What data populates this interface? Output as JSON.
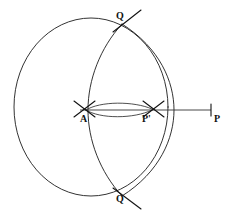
{
  "figure": {
    "background_color": "#ffffff",
    "stroke_color": "#1c1c1c",
    "width": 235,
    "height": 217
  },
  "labels": {
    "q_top": "Q",
    "q_bottom": "Q",
    "a": "A",
    "p_prime": "P'",
    "p": "P"
  },
  "geometry": {
    "main_circle": {
      "name": "main-circle",
      "cx": 91,
      "cy": 107,
      "rx": 77,
      "ry": 89
    },
    "qq_arc": {
      "name": "arc-through-q-top-and-q-bottom",
      "cx": 63,
      "cy": 107,
      "r": 107
    },
    "vertical_arc": {
      "name": "vertical-arc-through-a",
      "cx": 42,
      "cy": 107,
      "r": 98
    },
    "lens_upper": {
      "name": "lens-upper-arc",
      "from_x": 86,
      "from_y": 110,
      "to_x": 150,
      "to_y": 110
    },
    "lens_lower": {
      "name": "lens-lower-arc",
      "from_x": 86,
      "from_y": 110,
      "to_x": 150,
      "to_y": 110
    },
    "ray": {
      "name": "horizontal-ray-a-to-p",
      "x1": 80,
      "y1": 110,
      "x2": 212,
      "y2": 110
    }
  }
}
